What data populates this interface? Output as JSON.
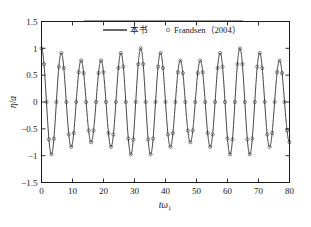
{
  "chart_data": {
    "type": "line",
    "title": "",
    "subtitle": "",
    "xlabel": "tω₁",
    "ylabel": "η/a",
    "xlim": [
      0,
      80
    ],
    "ylim": [
      -1.5,
      1.5
    ],
    "xticks": [
      0,
      10,
      20,
      30,
      40,
      50,
      60,
      70,
      80
    ],
    "xticklabels": [
      "0",
      "10",
      "20",
      "30",
      "40",
      "50",
      "60",
      "70",
      "80"
    ],
    "yticks": [
      -1.5,
      -1,
      -0.5,
      0,
      0.5,
      1,
      1.5
    ],
    "yticklabels": [
      "-1.5",
      "-1",
      "-0.5",
      "0",
      "0.5",
      "1",
      "1.5"
    ],
    "grid": false,
    "legend_position": "top-center",
    "legend": [
      {
        "label": "本书",
        "style": "solid-line",
        "marker": "none",
        "color": "#1a1a1a"
      },
      {
        "label": "Frandsen（2004）",
        "style": "none",
        "marker": "circle",
        "color": "#1a1a1a"
      }
    ],
    "series": [
      {
        "name": "本书",
        "render": "line",
        "description": "Amplitude-modulated standing-wave free-surface elevation; carrier period ~6.4 in tω₁, beat envelope modulates peak amplitude between ~0.75 and ~1.0",
        "model": {
          "carrier_period": 6.4,
          "phase": 0,
          "envelope_mean": 0.875,
          "envelope_amplitude": 0.125,
          "beat_period": 32.0,
          "beat_phase": 0.0
        }
      },
      {
        "name": "Frandsen（2004）",
        "render": "markers",
        "marker": "circle",
        "marker_size": 1.6,
        "sample_step": 0.8,
        "description": "Reference data points sampled along the same curve"
      }
    ],
    "annotations": []
  },
  "axes": {
    "frame_color": "#1a1a1a",
    "background": "#ffffff",
    "tick_direction": "in"
  },
  "colors": {
    "line": "#1a1a1a",
    "marker": "#1a1a1a",
    "text": "#1a1a1a",
    "background": "#ffffff"
  }
}
